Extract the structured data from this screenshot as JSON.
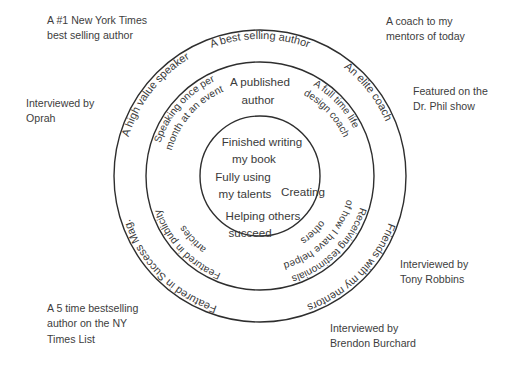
{
  "diagram": {
    "type": "concentric-circles",
    "title": "",
    "geometry": {
      "center_x": 260,
      "center_y": 176,
      "radii": [
        146,
        114,
        60
      ],
      "stroke_color": "#2e2e2e",
      "background_color": "#ffffff",
      "text_color": "#3a3a3a"
    },
    "rings": [
      {
        "name": "outer-ring",
        "radius": 146,
        "labels": [
          {
            "id": "best-selling-author",
            "text": "A best selling author",
            "position": "top"
          },
          {
            "id": "an-elite-coach",
            "text": "An elite coach",
            "position": "top-right"
          },
          {
            "id": "friends-with-my-mentors",
            "text": "Friends with my mentors",
            "position": "bottom-right"
          },
          {
            "id": "featured-in-success-mag",
            "text": "Featured in Success Mag.",
            "position": "bottom-left"
          },
          {
            "id": "a-high-value-speaker",
            "text": "A high value speaker",
            "position": "top-left"
          }
        ]
      },
      {
        "name": "middle-ring",
        "radius": 114,
        "labels": [
          {
            "id": "a-published-author",
            "text": "A published\nauthor",
            "position": "top"
          },
          {
            "id": "a-full-time-life-design-coach",
            "text": "A full time life\ndesign coach",
            "position": "top-right"
          },
          {
            "id": "receiving-testimonials",
            "text": "Receiving testimonials\nof how I have helped\nothers",
            "position": "bottom-right"
          },
          {
            "id": "featured-in-publicity-articles",
            "text": "Featured in publicity\narticles",
            "position": "bottom-left"
          },
          {
            "id": "speaking-once-per-month",
            "text": "Speaking once per\nmonth at an event",
            "position": "left"
          }
        ]
      },
      {
        "name": "inner-circle",
        "radius": 60,
        "labels": [
          {
            "id": "finished-writing-my-book",
            "text": "Finished writing\nmy book"
          },
          {
            "id": "fully-using-my-talents",
            "text": "Fully using\nmy talents"
          },
          {
            "id": "creating",
            "text": "Creating"
          },
          {
            "id": "helping-others-succeed",
            "text": "Helping others\nsucceed"
          }
        ]
      }
    ]
  },
  "curved": {
    "outer": {
      "best_selling_author": "A best selling author",
      "an_elite_coach": "An elite coach",
      "friends_with_my_mentors": "Friends with my mentors",
      "featured_in_success_mag": "Featured in Success Mag.",
      "a_high_value_speaker": "A high value speaker"
    },
    "middle": {
      "full_time_line1": "A full time life",
      "full_time_line2": "design coach",
      "testimonials_line1": "Receiving testimonials",
      "testimonials_line2": "of how I have helped",
      "testimonials_line3": "others",
      "publicity_line1": "Featured in publicity",
      "publicity_line2": "articles",
      "speaking_line1": "Speaking once per",
      "speaking_line2": "month at an event"
    }
  },
  "flat": {
    "published_author_line1": "A published",
    "published_author_line2": "author",
    "inner_line1": "Finished writing",
    "inner_line2": "my book",
    "inner_line3": "Fully using",
    "inner_line4": "my talents",
    "inner_creating": "Creating",
    "inner_line5": "Helping others",
    "inner_line6": "succeed"
  },
  "outside_labels": {
    "nyt_bestseller": "A #1 New York Times\nbest selling author",
    "coach_to_mentors": "A coach to my\nmentors of today",
    "interviewed_oprah": "Interviewed by\nOprah",
    "featured_dr_phil": "Featured on the\nDr. Phil show",
    "five_time_bestselling": "A 5 time bestselling\nauthor on the NY\nTimes List",
    "interviewed_tony": "Interviewed by\nTony Robbins",
    "interviewed_brendon": "Interviewed by\nBrendon Burchard"
  }
}
